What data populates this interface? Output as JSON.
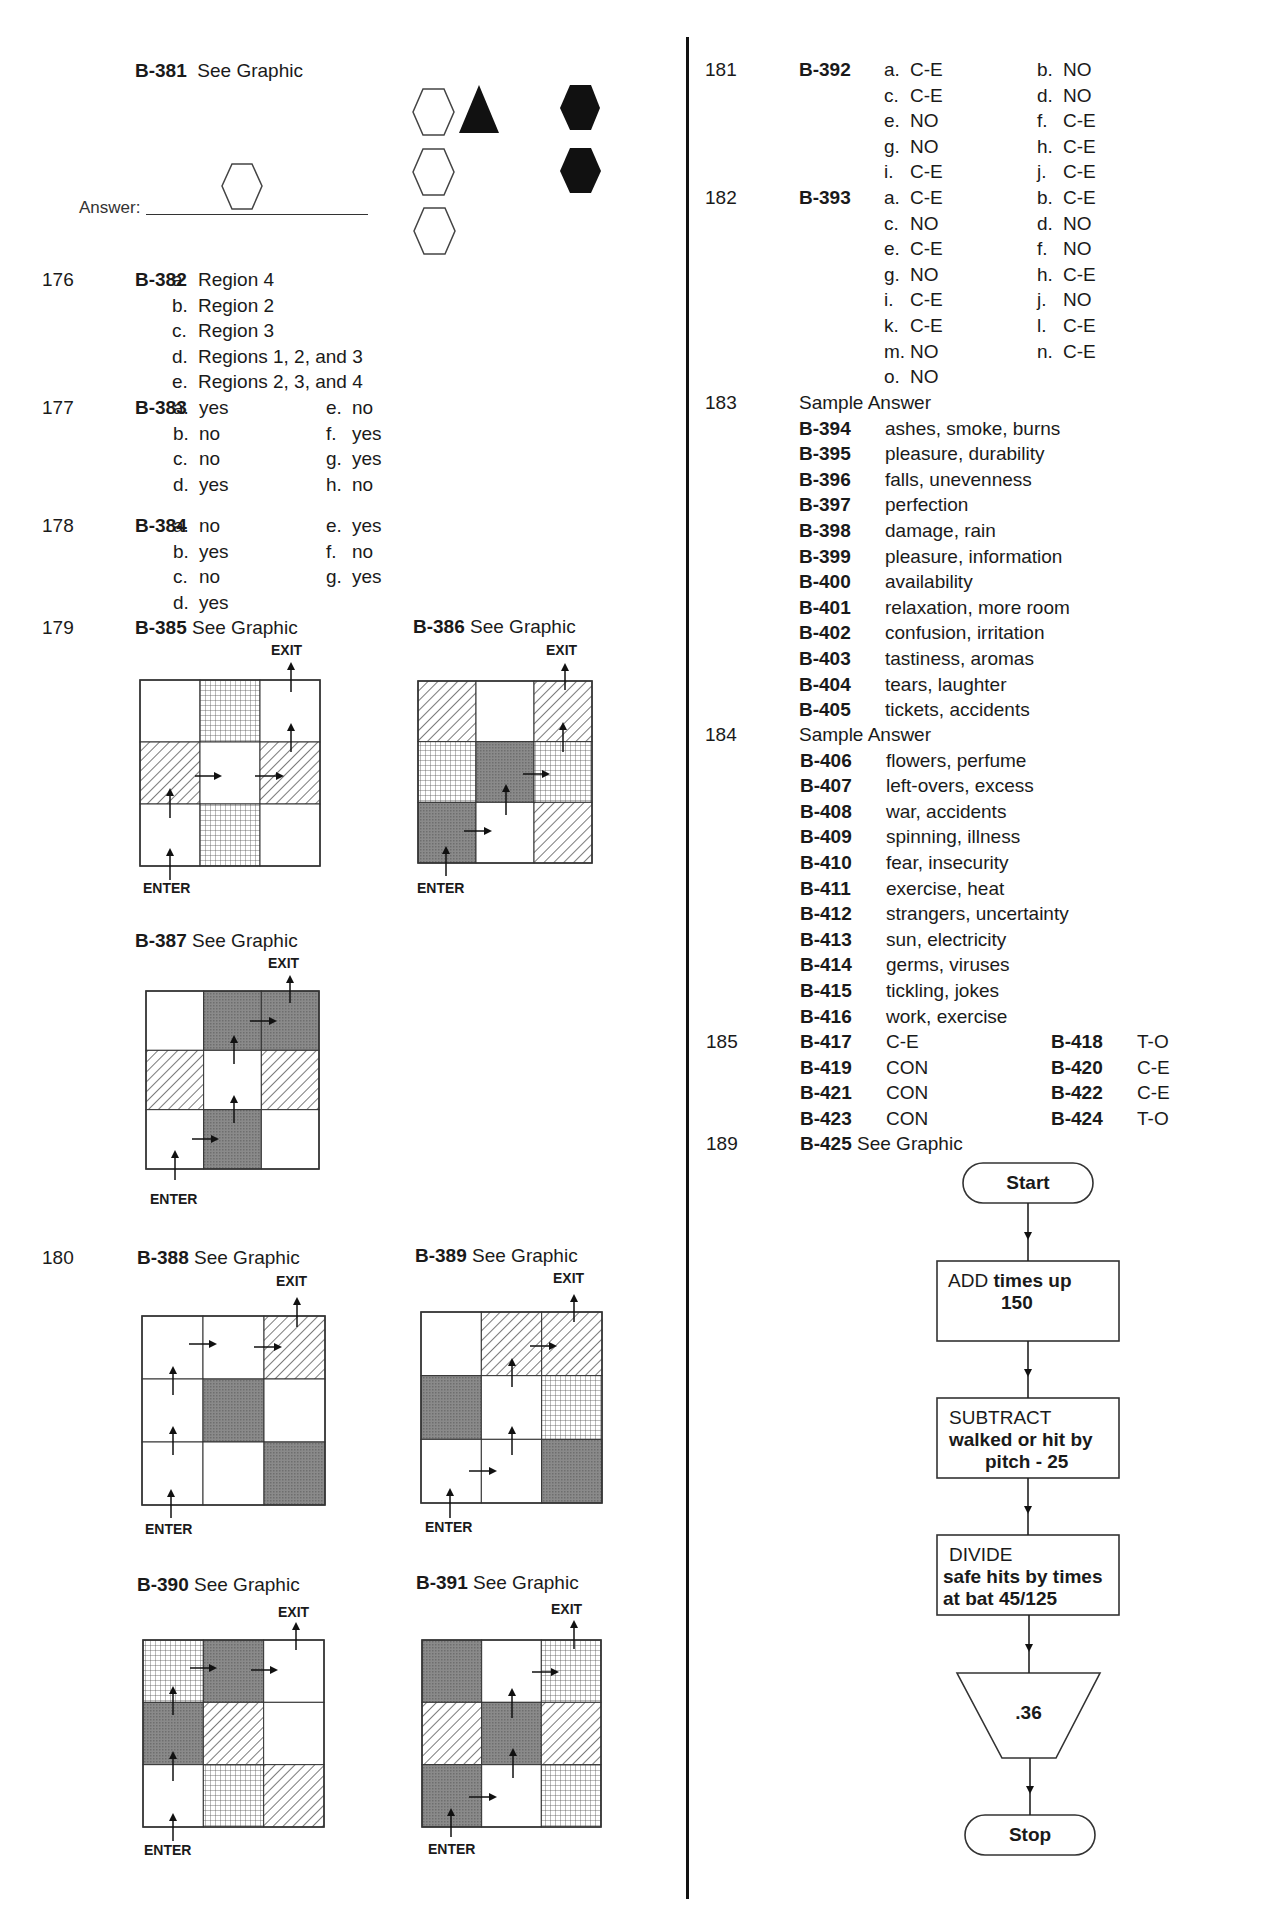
{
  "left": {
    "b381": {
      "id": "B-381",
      "text": "See Graphic",
      "answer_label": "Answer:"
    },
    "q176": {
      "num": "176",
      "id": "B-382",
      "items": [
        {
          "l": "a.",
          "v": "Region 4"
        },
        {
          "l": "b.",
          "v": "Region 2"
        },
        {
          "l": "c.",
          "v": "Region 3"
        },
        {
          "l": "d.",
          "v": "Regions 1, 2, and 3"
        },
        {
          "l": "e.",
          "v": "Regions 2, 3, and 4"
        }
      ]
    },
    "q177": {
      "num": "177",
      "id": "B-383",
      "col1": [
        {
          "l": "a.",
          "v": "yes"
        },
        {
          "l": "b.",
          "v": "no"
        },
        {
          "l": "c.",
          "v": "no"
        },
        {
          "l": "d.",
          "v": "yes"
        }
      ],
      "col2": [
        {
          "l": "e.",
          "v": "no"
        },
        {
          "l": "f.",
          "v": "yes"
        },
        {
          "l": "g.",
          "v": "yes"
        },
        {
          "l": "h.",
          "v": "no"
        }
      ]
    },
    "q178": {
      "num": "178",
      "id": "B-384",
      "col1": [
        {
          "l": "a.",
          "v": "no"
        },
        {
          "l": "b.",
          "v": "yes"
        },
        {
          "l": "c.",
          "v": "no"
        },
        {
          "l": "d.",
          "v": "yes"
        }
      ],
      "col2": [
        {
          "l": "e.",
          "v": "yes"
        },
        {
          "l": "f.",
          "v": "no"
        },
        {
          "l": "g.",
          "v": "yes"
        }
      ]
    },
    "q179": {
      "num": "179"
    },
    "q180": {
      "num": "180"
    },
    "mazes": [
      {
        "id": "B-385",
        "text": "See Graphic",
        "exit": "EXIT",
        "enter": "ENTER",
        "cells": [
          [
            "white",
            "grid",
            "white"
          ],
          [
            "hatch",
            "white",
            "hatch"
          ],
          [
            "white",
            "grid",
            "white"
          ]
        ]
      },
      {
        "id": "B-386",
        "text": "See Graphic",
        "exit": "EXIT",
        "enter": "ENTER",
        "cells": [
          [
            "hatch",
            "white",
            "hatch"
          ],
          [
            "grid",
            "dark",
            "grid"
          ],
          [
            "dark",
            "white",
            "hatch"
          ]
        ]
      },
      {
        "id": "B-387",
        "text": "See Graphic",
        "exit": "EXIT",
        "enter": "ENTER",
        "cells": [
          [
            "white",
            "dark",
            "dark"
          ],
          [
            "hatch",
            "white",
            "hatch"
          ],
          [
            "white",
            "dark",
            "white"
          ]
        ]
      },
      {
        "id": "B-388",
        "text": "See Graphic",
        "exit": "EXIT",
        "enter": "ENTER",
        "cells": [
          [
            "white",
            "white",
            "hatch"
          ],
          [
            "white",
            "dark",
            "white"
          ],
          [
            "white",
            "white",
            "dark"
          ]
        ]
      },
      {
        "id": "B-389",
        "text": "See Graphic",
        "exit": "EXIT",
        "enter": "ENTER",
        "cells": [
          [
            "white",
            "hatch",
            "hatch"
          ],
          [
            "dark",
            "white",
            "grid"
          ],
          [
            "white",
            "white",
            "dark"
          ]
        ]
      },
      {
        "id": "B-390",
        "text": "See Graphic",
        "exit": "EXIT",
        "enter": "ENTER",
        "cells": [
          [
            "grid",
            "dark",
            "white"
          ],
          [
            "dark",
            "hatch",
            "white"
          ],
          [
            "white",
            "grid",
            "hatch"
          ]
        ]
      },
      {
        "id": "B-391",
        "text": "See Graphic",
        "exit": "EXIT",
        "enter": "ENTER",
        "cells": [
          [
            "dark",
            "white",
            "grid"
          ],
          [
            "hatch",
            "dark",
            "hatch"
          ],
          [
            "dark",
            "white",
            "grid"
          ]
        ]
      }
    ]
  },
  "right": {
    "q181": {
      "num": "181",
      "id": "B-392",
      "col1": [
        {
          "l": "a.",
          "v": "C-E"
        },
        {
          "l": "c.",
          "v": "C-E"
        },
        {
          "l": "e.",
          "v": "NO"
        },
        {
          "l": "g.",
          "v": "NO"
        },
        {
          "l": "i.",
          "v": "C-E"
        }
      ],
      "col2": [
        {
          "l": "b.",
          "v": "NO"
        },
        {
          "l": "d.",
          "v": "NO"
        },
        {
          "l": "f.",
          "v": "C-E"
        },
        {
          "l": "h.",
          "v": "C-E"
        },
        {
          "l": "j.",
          "v": "C-E"
        }
      ]
    },
    "q182": {
      "num": "182",
      "id": "B-393",
      "col1": [
        {
          "l": "a.",
          "v": "C-E"
        },
        {
          "l": "c.",
          "v": "NO"
        },
        {
          "l": "e.",
          "v": "C-E"
        },
        {
          "l": "g.",
          "v": "NO"
        },
        {
          "l": "i.",
          "v": "C-E"
        },
        {
          "l": "k.",
          "v": "C-E"
        },
        {
          "l": "m.",
          "v": "NO"
        },
        {
          "l": "o.",
          "v": "NO"
        }
      ],
      "col2": [
        {
          "l": "b.",
          "v": "C-E"
        },
        {
          "l": "d.",
          "v": "NO"
        },
        {
          "l": "f.",
          "v": "NO"
        },
        {
          "l": "h.",
          "v": "C-E"
        },
        {
          "l": "j.",
          "v": "NO"
        },
        {
          "l": "l.",
          "v": "C-E"
        },
        {
          "l": "n.",
          "v": "C-E"
        }
      ]
    },
    "q183": {
      "num": "183",
      "heading": "Sample Answer",
      "items": [
        {
          "id": "B-394",
          "v": "ashes, smoke, burns"
        },
        {
          "id": "B-395",
          "v": "pleasure, durability"
        },
        {
          "id": "B-396",
          "v": "falls, unevenness"
        },
        {
          "id": "B-397",
          "v": "perfection"
        },
        {
          "id": "B-398",
          "v": "damage, rain"
        },
        {
          "id": "B-399",
          "v": "pleasure, information"
        },
        {
          "id": "B-400",
          "v": "availability"
        },
        {
          "id": "B-401",
          "v": "relaxation, more room"
        },
        {
          "id": "B-402",
          "v": "confusion, irritation"
        },
        {
          "id": "B-403",
          "v": "tastiness, aromas"
        },
        {
          "id": "B-404",
          "v": "tears, laughter"
        },
        {
          "id": "B-405",
          "v": "tickets, accidents"
        }
      ]
    },
    "q184": {
      "num": "184",
      "heading": "Sample Answer",
      "items": [
        {
          "id": "B-406",
          "v": "flowers, perfume"
        },
        {
          "id": "B-407",
          "v": "left-overs, excess"
        },
        {
          "id": "B-408",
          "v": "war, accidents"
        },
        {
          "id": "B-409",
          "v": "spinning, illness"
        },
        {
          "id": "B-410",
          "v": "fear, insecurity"
        },
        {
          "id": "B-411",
          "v": "exercise, heat"
        },
        {
          "id": "B-412",
          "v": "strangers, uncertainty"
        },
        {
          "id": "B-413",
          "v": "sun, electricity"
        },
        {
          "id": "B-414",
          "v": "germs, viruses"
        },
        {
          "id": "B-415",
          "v": "tickling, jokes"
        },
        {
          "id": "B-416",
          "v": "work, exercise"
        }
      ]
    },
    "q185": {
      "num": "185",
      "rows": [
        {
          "id1": "B-417",
          "v1": "C-E",
          "id2": "B-418",
          "v2": "T-O"
        },
        {
          "id1": "B-419",
          "v1": "CON",
          "id2": "B-420",
          "v2": "C-E"
        },
        {
          "id1": "B-421",
          "v1": "CON",
          "id2": "B-422",
          "v2": "C-E"
        },
        {
          "id1": "B-423",
          "v1": "CON",
          "id2": "B-424",
          "v2": "T-O"
        }
      ]
    },
    "q189": {
      "num": "189",
      "id": "B-425",
      "text": "See Graphic"
    },
    "flowchart": {
      "start": "Start",
      "add_op": "ADD",
      "add_text": "times up",
      "add_value": "150",
      "sub_op": "SUBTRACT",
      "sub_text": "walked or hit by",
      "sub_value": "pitch - 25",
      "div_op": "DIVIDE",
      "div_text1": "safe hits by times",
      "div_text2": "at bat 45/125",
      "output": ".36",
      "stop": "Stop"
    }
  }
}
